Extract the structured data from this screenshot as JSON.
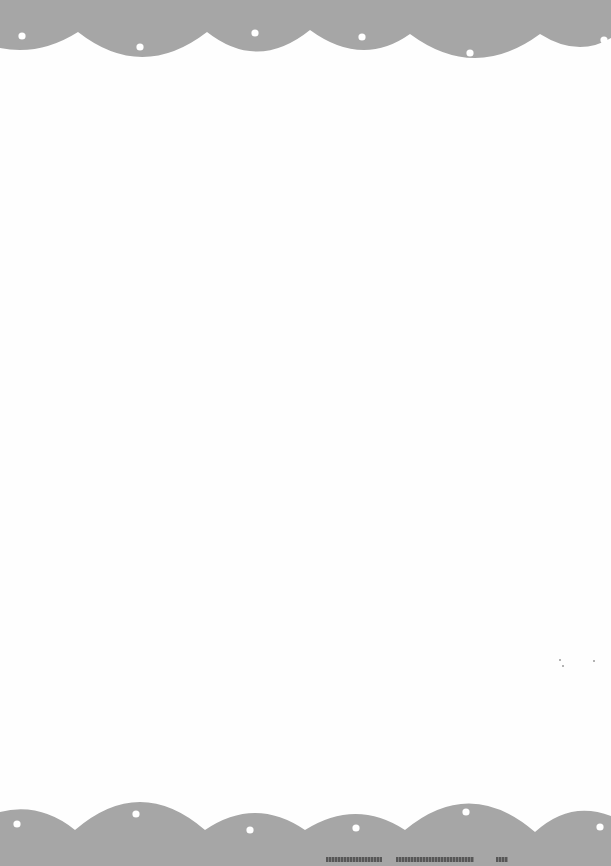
{
  "page": {
    "background": "#fefefe",
    "border_color": "#a6a6a6",
    "dot_color": "#ffffff",
    "body_text": ""
  },
  "top_border": {
    "style": "scalloped",
    "dots": [
      {
        "x": 22,
        "y": 36
      },
      {
        "x": 140,
        "y": 47
      },
      {
        "x": 255,
        "y": 33
      },
      {
        "x": 362,
        "y": 37
      },
      {
        "x": 470,
        "y": 53
      },
      {
        "x": 604,
        "y": 40
      }
    ]
  },
  "bottom_border": {
    "style": "scalloped",
    "dots": [
      {
        "x": 17,
        "y": 824
      },
      {
        "x": 136,
        "y": 814
      },
      {
        "x": 250,
        "y": 830
      },
      {
        "x": 356,
        "y": 828
      },
      {
        "x": 466,
        "y": 812
      },
      {
        "x": 600,
        "y": 827
      }
    ]
  },
  "footer": {
    "text_legible": false,
    "text": ""
  }
}
